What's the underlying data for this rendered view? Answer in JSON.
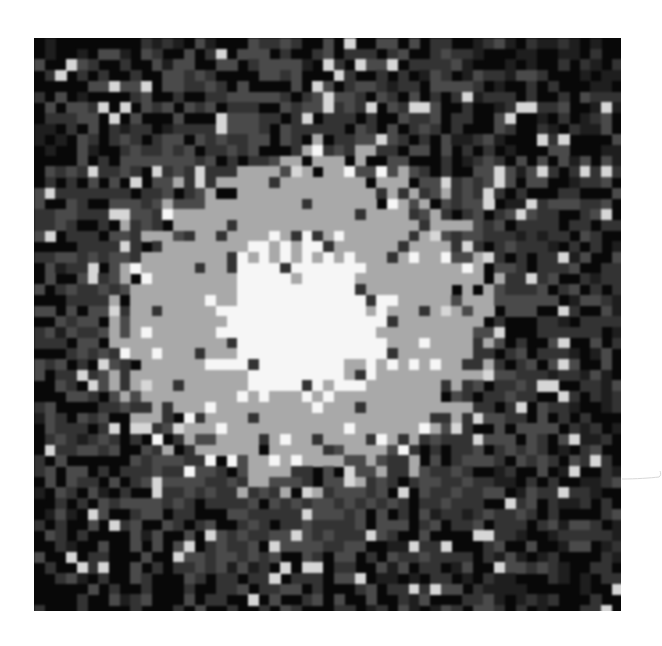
{
  "image": {
    "subject": "pixelated grayscale astronomical object with bright saturated core",
    "frame": {
      "left": 34,
      "top": 38,
      "width": 587,
      "height": 573
    },
    "grid": {
      "cols": 55,
      "rows": 54,
      "cell_size": 10.7
    },
    "palette": {
      "black": "#080808",
      "dark": "#1e1e1e",
      "mid_dark": "#333333",
      "mid": "#4a4a4a",
      "light_gray": "#a9a9a9",
      "bright": "#d6d6d6",
      "white": "#f6f6f6"
    },
    "profile": {
      "center_x": 266,
      "center_y": 282,
      "core_radius": 88,
      "body_radius_x": 195,
      "body_radius_y": 170,
      "halo_radius": 300
    },
    "seed": 1337
  },
  "margin_mark": {
    "visible": true,
    "color": "#d8d8d8"
  }
}
